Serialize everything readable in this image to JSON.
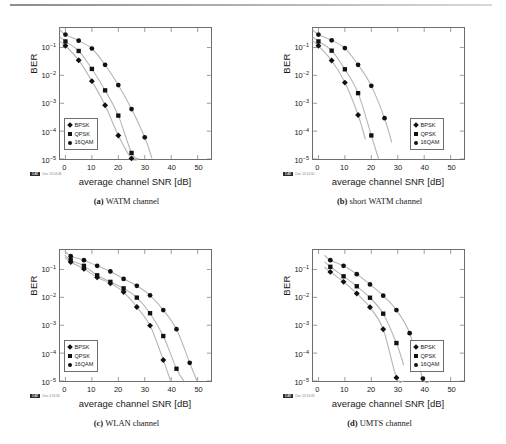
{
  "figure": {
    "panels": [
      {
        "key": "a",
        "caption_label": "(a)",
        "caption_text": "WATM channel",
        "legend_pos": "bottom-left",
        "stamp_code": "DAT",
        "stamp_date": "Dec 13 14:48",
        "chart_data": {
          "type": "scatter",
          "title": "WATM channel",
          "xlabel": "average channel SNR [dB]",
          "ylabel": "BER",
          "xlim": [
            -2,
            55
          ],
          "ylim": [
            1e-05,
            0.5
          ],
          "yscale": "log",
          "xticks": [
            0,
            10,
            20,
            30,
            40,
            50
          ],
          "yticks": [
            "10-1",
            "10-2",
            "10-3",
            "10-4",
            "10-5"
          ],
          "grid": false,
          "legend": [
            "BPSK",
            "QPSK",
            "16QAM"
          ],
          "series": [
            {
              "name": "BPSK",
              "marker": "diamond",
              "x": [
                0,
                5,
                10,
                15,
                20,
                25
              ],
              "y": [
                0.115,
                0.035,
                0.0062,
                0.00085,
                7e-05,
                1.05e-05
              ]
            },
            {
              "name": "QPSK",
              "marker": "square",
              "x": [
                0,
                5,
                10,
                15,
                20,
                25
              ],
              "y": [
                0.165,
                0.075,
                0.017,
                0.0029,
                0.00036,
                1.65e-05
              ]
            },
            {
              "name": "16QAM",
              "marker": "circle",
              "x": [
                0,
                5,
                10,
                15,
                20,
                25,
                30
              ],
              "y": [
                0.29,
                0.175,
                0.092,
                0.024,
                0.0045,
                0.00062,
                6e-05
              ]
            }
          ]
        }
      },
      {
        "key": "b",
        "caption_label": "(b)",
        "caption_text": "short WATM channel",
        "legend_pos": "bottom-right",
        "stamp_code": "DAT",
        "stamp_date": "Dec 13 14:50",
        "chart_data": {
          "type": "scatter",
          "title": "short WATM channel",
          "xlabel": "average channel SNR [dB]",
          "ylabel": "BER",
          "xlim": [
            -2,
            55
          ],
          "ylim": [
            1e-05,
            0.5
          ],
          "yscale": "log",
          "xticks": [
            0,
            10,
            20,
            30,
            40,
            50
          ],
          "yticks": [
            "10-1",
            "10-2",
            "10-3",
            "10-4",
            "10-5"
          ],
          "grid": false,
          "legend": [
            "BPSK",
            "QPSK",
            "16QAM"
          ],
          "series": [
            {
              "name": "BPSK",
              "marker": "diamond",
              "x": [
                0,
                5,
                10,
                15
              ],
              "y": [
                0.115,
                0.034,
                0.0055,
                0.00038
              ]
            },
            {
              "name": "QPSK",
              "marker": "square",
              "x": [
                0,
                5,
                10,
                15,
                20
              ],
              "y": [
                0.165,
                0.077,
                0.0165,
                0.0023,
                7e-05
              ]
            },
            {
              "name": "16QAM",
              "marker": "circle",
              "x": [
                0,
                5,
                10,
                15,
                20,
                25
              ],
              "y": [
                0.29,
                0.18,
                0.095,
                0.024,
                0.0042,
                0.00029
              ]
            }
          ]
        }
      },
      {
        "key": "c",
        "caption_label": "(c)",
        "caption_text": "WLAN channel",
        "legend_pos": "bottom-left",
        "stamp_code": "DAT",
        "stamp_date": "Dec 4 13:30",
        "chart_data": {
          "type": "scatter",
          "title": "WLAN channel",
          "xlabel": "average channel SNR [dB]",
          "ylabel": "BER",
          "xlim": [
            -2,
            55
          ],
          "ylim": [
            1e-05,
            0.5
          ],
          "yscale": "log",
          "xticks": [
            0,
            10,
            20,
            30,
            40,
            50
          ],
          "yticks": [
            "10-1",
            "10-2",
            "10-3",
            "10-4",
            "10-5"
          ],
          "grid": false,
          "legend": [
            "BPSK",
            "QPSK",
            "16QAM"
          ],
          "series": [
            {
              "name": "BPSK",
              "marker": "diamond",
              "x": [
                2,
                7,
                12,
                17,
                22,
                27,
                32,
                37
              ],
              "y": [
                0.185,
                0.105,
                0.052,
                0.032,
                0.0155,
                0.0045,
                0.00097,
                5.7e-05
              ]
            },
            {
              "name": "QPSK",
              "marker": "square",
              "x": [
                2,
                7,
                12,
                17,
                22,
                27,
                32,
                37,
                42
              ],
              "y": [
                0.215,
                0.135,
                0.062,
                0.036,
                0.021,
                0.0098,
                0.0027,
                0.00041,
                2.75e-05
              ]
            },
            {
              "name": "16QAM",
              "marker": "circle",
              "x": [
                2,
                7,
                12,
                17,
                22,
                27,
                32,
                37,
                42,
                47
              ],
              "y": [
                0.3,
                0.215,
                0.135,
                0.085,
                0.046,
                0.026,
                0.0118,
                0.0035,
                0.00072,
                4.5e-05
              ]
            }
          ]
        }
      },
      {
        "key": "d",
        "caption_label": "(d)",
        "caption_text": "UMTS channel",
        "legend_pos": "bottom-right",
        "stamp_code": "DAT",
        "stamp_date": "Dec 13 13:43",
        "chart_data": {
          "type": "scatter",
          "title": "UMTS channel",
          "xlabel": "average channel SNR [dB]",
          "ylabel": "BER",
          "xlim": [
            -2,
            55
          ],
          "ylim": [
            1e-05,
            0.5
          ],
          "yscale": "log",
          "xticks": [
            0,
            10,
            20,
            30,
            40,
            50
          ],
          "yticks": [
            "10-1",
            "10-2",
            "10-3",
            "10-4",
            "10-5"
          ],
          "grid": false,
          "legend": [
            "BPSK",
            "QPSK",
            "16QAM"
          ],
          "series": [
            {
              "name": "BPSK",
              "marker": "diamond",
              "x": [
                4.5,
                9.5,
                14.5,
                19.5,
                24.5,
                29.5
              ],
              "y": [
                0.082,
                0.036,
                0.0138,
                0.0044,
                0.00072,
                1.32e-05
              ]
            },
            {
              "name": "QPSK",
              "marker": "square",
              "x": [
                4.5,
                9.5,
                14.5,
                19.5,
                24.5,
                29.5
              ],
              "y": [
                0.125,
                0.057,
                0.025,
                0.0097,
                0.0026,
                0.00023
              ]
            },
            {
              "name": "16QAM",
              "marker": "circle",
              "x": [
                4.5,
                9.5,
                14.5,
                19.5,
                24.5,
                29.5,
                34.5,
                39.5
              ],
              "y": [
                0.215,
                0.135,
                0.068,
                0.029,
                0.0115,
                0.0035,
                0.00052,
                1.22e-05
              ]
            }
          ]
        }
      }
    ]
  }
}
